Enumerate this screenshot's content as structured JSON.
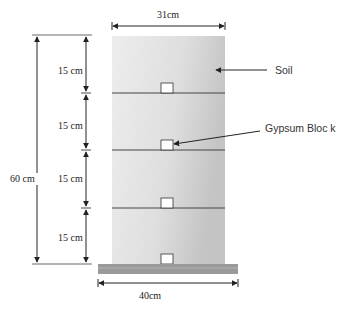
{
  "diagram": {
    "dimensions": {
      "column_width": "31cm",
      "base_width": "40cm",
      "total_height": "60 cm",
      "layers": [
        "15 cm",
        "15 cm",
        "15 cm",
        "15 cm"
      ]
    },
    "labels": {
      "soil": "Soil",
      "gypsum_block": "Gypsum Bloc k"
    },
    "colors": {
      "soil_light": "#ececec",
      "soil_dark": "#c8c8c8",
      "base_plate": "#9a9a9a",
      "lines": "#333333"
    }
  }
}
